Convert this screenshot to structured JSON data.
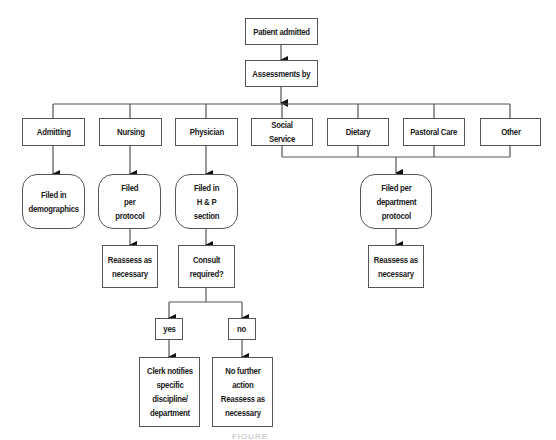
{
  "diagram": {
    "type": "flowchart",
    "nodes": {
      "patient_admitted": "Patient admitted",
      "assessments_by": "Assessments by",
      "admitting": "Admitting",
      "nursing": "Nursing",
      "physician": "Physician",
      "social_service": "Social Service",
      "dietary": "Dietary",
      "pastoral_care": "Pastoral Care",
      "other": "Other",
      "filed_demographics": "Filed in\ndemographics",
      "filed_per_protocol": "Filed\nper\nprotocol",
      "filed_hp_section": "Filed in\nH & P\nsection",
      "filed_department_protocol": "Filed per\ndepartment\nprotocol",
      "nursing_reassess": "Reassess as\nnecessary",
      "consult_required": "Consult\nrequired?",
      "dept_reassess": "Reassess as\nnecessary",
      "yes": "yes",
      "no": "no",
      "clerk_notifies": "Clerk notifies\nspecific\ndiscipline/\ndepartment",
      "no_further_action": "No further\naction\nReassess as\nnecessary"
    },
    "edges": [
      [
        "patient_admitted",
        "assessments_by"
      ],
      [
        "assessments_by",
        "admitting"
      ],
      [
        "assessments_by",
        "nursing"
      ],
      [
        "assessments_by",
        "physician"
      ],
      [
        "assessments_by",
        "social_service"
      ],
      [
        "assessments_by",
        "dietary"
      ],
      [
        "assessments_by",
        "pastoral_care"
      ],
      [
        "assessments_by",
        "other"
      ],
      [
        "admitting",
        "filed_demographics"
      ],
      [
        "nursing",
        "filed_per_protocol"
      ],
      [
        "physician",
        "filed_hp_section"
      ],
      [
        "social_service",
        "filed_department_protocol"
      ],
      [
        "dietary",
        "filed_department_protocol"
      ],
      [
        "pastoral_care",
        "filed_department_protocol"
      ],
      [
        "other",
        "filed_department_protocol"
      ],
      [
        "filed_per_protocol",
        "nursing_reassess"
      ],
      [
        "filed_hp_section",
        "consult_required"
      ],
      [
        "filed_department_protocol",
        "dept_reassess"
      ],
      [
        "consult_required",
        "yes"
      ],
      [
        "consult_required",
        "no"
      ],
      [
        "yes",
        "clerk_notifies"
      ],
      [
        "no",
        "no_further_action"
      ]
    ],
    "caption": "FIGURE"
  }
}
